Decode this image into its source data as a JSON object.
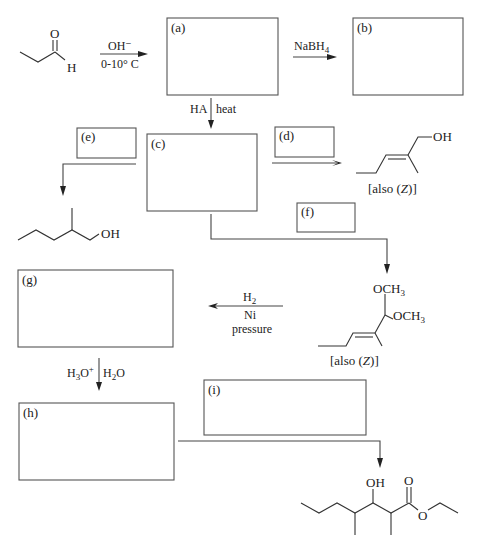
{
  "boxes": {
    "a": {
      "label": "(a)"
    },
    "b": {
      "label": "(b)"
    },
    "c": {
      "label": "(c)"
    },
    "d": {
      "label": "(d)"
    },
    "e": {
      "label": "(e)"
    },
    "f": {
      "label": "(f)"
    },
    "g": {
      "label": "(g)"
    },
    "h": {
      "label": "(h)"
    },
    "i": {
      "label": "(i)"
    }
  },
  "reagents": {
    "step1_top": "OH⁻",
    "step1_bottom": "0-10° C",
    "step2_top": "NaBH",
    "step2_sub": "4",
    "step3_left": "HA",
    "step3_right": "heat",
    "h2_top": "H",
    "h2_sub": "2",
    "ni": "Ni",
    "pressure": "pressure",
    "hydrolysis_left_h": "H",
    "hydrolysis_left_sub": "3",
    "hydrolysis_left_o": "O",
    "hydrolysis_left_sup": "+",
    "hydrolysis_right_h": "H",
    "hydrolysis_right_sub": "2",
    "hydrolysis_right_o": "O"
  },
  "structures": {
    "propanal": {
      "o": "O",
      "h": "H"
    },
    "unsat_alcohol": {
      "oh": "OH",
      "note_prefix": "[also (",
      "note_z": "Z",
      "note_suffix": ")]"
    },
    "saturated_alcohol": {
      "oh": "OH"
    },
    "acetal": {
      "och3_top": "OCH",
      "och3_bottom": "OCH",
      "sub3": "3",
      "note_prefix": "[also (",
      "note_z": "Z",
      "note_suffix": ")]"
    },
    "ester": {
      "oh": "OH",
      "carbonyl_o": "O",
      "ester_o": "O"
    }
  }
}
